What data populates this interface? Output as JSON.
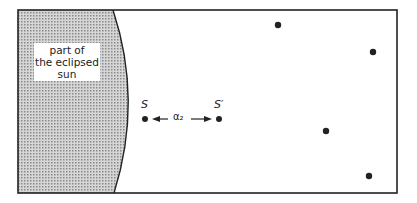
{
  "diagram": {
    "sun_label_lines": [
      "part of",
      "the eclipsed",
      "sun"
    ],
    "star_labels": {
      "apparent": "S",
      "true": "S′"
    },
    "separation_label": "α₂",
    "stars": [
      {
        "x": 278,
        "y": 25
      },
      {
        "x": 373,
        "y": 52
      },
      {
        "x": 326,
        "y": 131
      },
      {
        "x": 369,
        "y": 176
      }
    ],
    "pair": [
      {
        "x": 145,
        "y": 119
      },
      {
        "x": 219,
        "y": 119
      }
    ],
    "colors": {
      "ink": "#222222",
      "sun_fill": "#b8b8b8"
    }
  }
}
